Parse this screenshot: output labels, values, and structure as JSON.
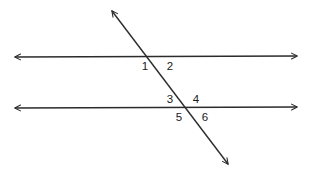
{
  "figure": {
    "kind": "geometry-diagram",
    "background_color": "#ffffff",
    "stroke_color": "#2b2b2b",
    "label_color": "#1a1a1a",
    "stroke_width": 1.4,
    "width": 312,
    "height": 175
  },
  "lines": [
    {
      "name": "upper-parallel-line",
      "type": "double-arrow-line",
      "x1": 15,
      "y1": 57,
      "x2": 297,
      "y2": 56,
      "arrow_start": true,
      "arrow_end": true
    },
    {
      "name": "lower-parallel-line",
      "type": "double-arrow-line",
      "x1": 15,
      "y1": 108,
      "x2": 297,
      "y2": 107,
      "arrow_start": true,
      "arrow_end": true
    },
    {
      "name": "transversal-line",
      "type": "double-arrow-line",
      "x1": 112,
      "y1": 11,
      "x2": 228,
      "y2": 164,
      "arrow_start": true,
      "arrow_end": true
    }
  ],
  "intersections": [
    {
      "name": "upper-intersection",
      "x": 157,
      "y": 57
    },
    {
      "name": "lower-intersection",
      "x": 186,
      "y": 107
    }
  ],
  "angle_labels": [
    {
      "id": "angle-1",
      "text": "1",
      "x": 145,
      "y": 67,
      "position": "upper-intersection-left-below"
    },
    {
      "id": "angle-2",
      "text": "2",
      "x": 170,
      "y": 67,
      "position": "upper-intersection-right-below"
    },
    {
      "id": "angle-3",
      "text": "3",
      "x": 170,
      "y": 100,
      "position": "lower-intersection-left-above"
    },
    {
      "id": "angle-4",
      "text": "4",
      "x": 196,
      "y": 100,
      "position": "lower-intersection-right-above"
    },
    {
      "id": "angle-5",
      "text": "5",
      "x": 179,
      "y": 118,
      "position": "lower-intersection-left-below"
    },
    {
      "id": "angle-6",
      "text": "6",
      "x": 205,
      "y": 118,
      "position": "lower-intersection-right-below"
    }
  ]
}
